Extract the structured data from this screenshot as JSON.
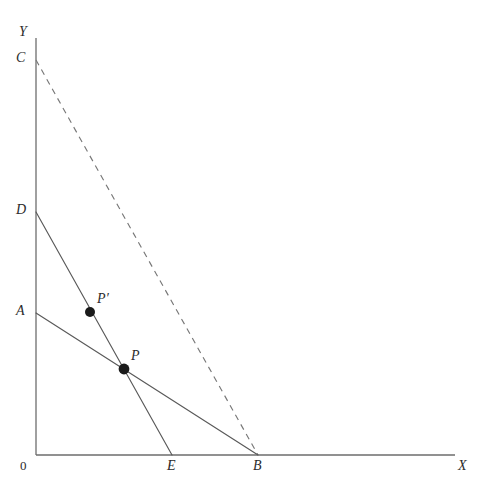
{
  "figure": {
    "background_color": "#ffffff",
    "width": 490,
    "height": 490,
    "line_color": "#595959",
    "axis_color": "#6d6d6d",
    "dashed_color": "#777777",
    "point_color": "#1a1a1a"
  },
  "axes": {
    "x_axis_label": "X",
    "y_axis_label": "Y",
    "origin_label": "0",
    "x_axis": {
      "x1": 36,
      "y1": 455,
      "x2": 455,
      "y2": 455
    },
    "y_axis": {
      "x1": 36,
      "y1": 38,
      "x2": 36,
      "y2": 455
    }
  },
  "axis_labels": {
    "y": {
      "text": "Y",
      "x": 19,
      "y": 25
    },
    "x": {
      "text": "X",
      "x": 458,
      "y": 459
    },
    "origin": {
      "text": "0",
      "x": 20,
      "y": 459
    }
  },
  "intercepts": [
    {
      "id": "C",
      "label": "C",
      "axis": "y",
      "x": 36,
      "y": 60,
      "label_x": 16,
      "label_y": 51
    },
    {
      "id": "D",
      "label": "D",
      "axis": "y",
      "x": 36,
      "y": 212,
      "label_x": 16,
      "label_y": 203
    },
    {
      "id": "A",
      "label": "A",
      "axis": "y",
      "x": 36,
      "y": 313,
      "label_x": 16,
      "label_y": 304
    },
    {
      "id": "E",
      "label": "E",
      "axis": "x",
      "x": 172,
      "y": 455,
      "label_x": 167,
      "label_y": 459
    },
    {
      "id": "B",
      "label": "B",
      "axis": "x",
      "x": 258,
      "y": 455,
      "label_x": 253,
      "label_y": 459
    }
  ],
  "lines": [
    {
      "id": "DE",
      "name": "steep-budget-line",
      "style": "solid",
      "from": "D",
      "to": "E",
      "x1": 36,
      "y1": 212,
      "x2": 172,
      "y2": 455
    },
    {
      "id": "AB",
      "name": "flat-budget-line",
      "style": "solid",
      "from": "A",
      "to": "B",
      "x1": 36,
      "y1": 313,
      "x2": 258,
      "y2": 455
    },
    {
      "id": "CB",
      "name": "compensated-budget-line",
      "style": "dashed",
      "from": "C",
      "to": "B",
      "x1": 36,
      "y1": 60,
      "x2": 258,
      "y2": 455
    }
  ],
  "points": [
    {
      "id": "P_prime",
      "label": "P′",
      "x": 90,
      "y": 312,
      "radius": 5.0,
      "label_x": 97,
      "label_y": 292,
      "on_line": "DE"
    },
    {
      "id": "P",
      "label": "P",
      "x": 124,
      "y": 369,
      "radius": 5.4,
      "label_x": 131,
      "label_y": 349,
      "on_line": "DE-AB-intersection"
    }
  ],
  "chart_data": {
    "type": "line",
    "title": "",
    "xlabel": "X",
    "ylabel": "Y",
    "grid": false,
    "legend": "none",
    "xlim": [
      0,
      419
    ],
    "ylim": [
      0,
      417
    ],
    "series": [
      {
        "name": "DE",
        "style": "solid",
        "points": [
          {
            "x": 0,
            "y": 243
          },
          {
            "x": 136,
            "y": 0
          }
        ]
      },
      {
        "name": "AB",
        "style": "solid",
        "points": [
          {
            "x": 0,
            "y": 142
          },
          {
            "x": 222,
            "y": 0
          }
        ]
      },
      {
        "name": "CB",
        "style": "dashed",
        "points": [
          {
            "x": 0,
            "y": 395
          },
          {
            "x": 222,
            "y": 0
          }
        ]
      }
    ],
    "annotations": [
      {
        "text": "C",
        "x": 0,
        "y": 395
      },
      {
        "text": "D",
        "x": 0,
        "y": 243
      },
      {
        "text": "A",
        "x": 0,
        "y": 142
      },
      {
        "text": "E",
        "x": 136,
        "y": 0
      },
      {
        "text": "B",
        "x": 222,
        "y": 0
      },
      {
        "text": "P′",
        "x": 54,
        "y": 143
      },
      {
        "text": "P",
        "x": 88,
        "y": 86
      },
      {
        "text": "0",
        "x": 0,
        "y": 0
      }
    ]
  }
}
